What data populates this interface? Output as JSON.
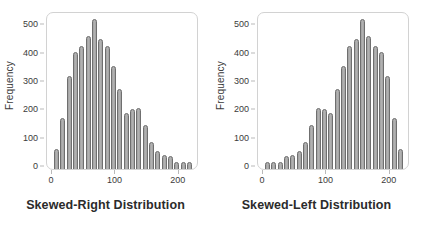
{
  "figure": {
    "background_color": "#ffffff",
    "bar_color": "#a9a9a9",
    "bar_edge_color": "#6f6f6f",
    "frame_color": "#d2d2d2",
    "text_color": "#3b3b3b"
  },
  "chart_data": [
    {
      "type": "bar",
      "title": "Skewed-Right Distribution",
      "xlabel": "",
      "ylabel": "Frequency",
      "xlim": [
        -8,
        232
      ],
      "ylim": [
        0,
        530
      ],
      "grid": false,
      "legend": null,
      "xticks": [
        0,
        100,
        200
      ],
      "yticks": [
        0,
        100,
        200,
        300,
        400,
        500
      ],
      "bin_width": 10,
      "x": [
        7,
        17,
        27,
        37,
        47,
        57,
        67,
        77,
        87,
        97,
        107,
        117,
        127,
        137,
        147,
        157,
        167,
        177,
        187,
        197,
        207,
        217
      ],
      "values": [
        55,
        165,
        310,
        395,
        415,
        450,
        510,
        440,
        415,
        345,
        265,
        180,
        195,
        200,
        140,
        80,
        50,
        35,
        30,
        10,
        10,
        10
      ],
      "categories": [
        "7",
        "17",
        "27",
        "37",
        "47",
        "57",
        "67",
        "77",
        "87",
        "97",
        "107",
        "117",
        "127",
        "137",
        "147",
        "157",
        "167",
        "177",
        "187",
        "197",
        "207",
        "217"
      ]
    },
    {
      "type": "bar",
      "title": "Skewed-Left Distribution",
      "xlabel": "",
      "ylabel": "Frequency",
      "xlim": [
        -8,
        232
      ],
      "ylim": [
        0,
        530
      ],
      "grid": false,
      "legend": null,
      "xticks": [
        0,
        100,
        200
      ],
      "yticks": [
        0,
        100,
        200,
        300,
        400,
        500
      ],
      "bin_width": 10,
      "x": [
        7,
        17,
        27,
        37,
        47,
        57,
        67,
        77,
        87,
        97,
        107,
        117,
        127,
        137,
        147,
        157,
        167,
        177,
        187,
        197,
        207,
        217
      ],
      "values": [
        10,
        10,
        10,
        30,
        35,
        50,
        80,
        140,
        200,
        195,
        180,
        265,
        345,
        415,
        440,
        510,
        450,
        415,
        395,
        310,
        165,
        55
      ],
      "categories": [
        "7",
        "17",
        "27",
        "37",
        "47",
        "57",
        "67",
        "77",
        "87",
        "97",
        "107",
        "117",
        "127",
        "137",
        "147",
        "157",
        "167",
        "177",
        "187",
        "197",
        "207",
        "217"
      ]
    }
  ]
}
